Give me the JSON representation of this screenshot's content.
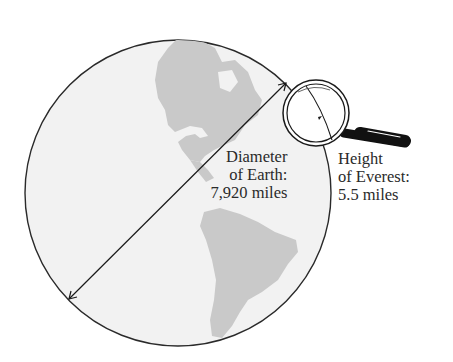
{
  "diagram": {
    "earth": {
      "label_lines": [
        "Diameter",
        "of Earth:",
        "7,920 miles"
      ],
      "value": "7,920 miles",
      "fill_color": "#f2f2f2",
      "land_color": "#c8c8c8",
      "outline_color": "#2a2a2a"
    },
    "everest": {
      "label_lines": [
        "Height",
        "of Everest:",
        "5.5 miles"
      ],
      "value": "5.5 miles"
    },
    "icons": {
      "magnifier": "magnifying-glass-icon",
      "arrow": "double-headed-arrow"
    }
  }
}
